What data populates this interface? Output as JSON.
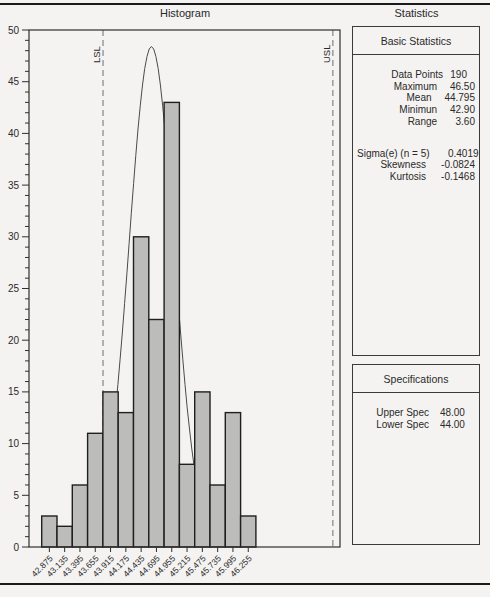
{
  "header": {
    "chart_title": "Histogram",
    "stats_title": "Statistics"
  },
  "chart_data": {
    "type": "bar",
    "title": "Histogram",
    "categories": [
      "42.875",
      "43.135",
      "43.395",
      "43.655",
      "43.915",
      "44.175",
      "44.435",
      "44.695",
      "44.955",
      "45.215",
      "45.475",
      "45.735",
      "45.995",
      "46.255"
    ],
    "values": [
      3,
      2,
      6,
      11,
      15,
      13,
      30,
      22,
      43,
      8,
      15,
      6,
      13,
      3
    ],
    "xlabel": "",
    "ylabel": "",
    "ylim": [
      0,
      50
    ],
    "y_major_step": 5,
    "y_minor_step": 1,
    "bin_width": 0.26,
    "grid": false,
    "legend": false,
    "bar_fill": "#bcbcba",
    "bar_stroke": "#1f1f1f",
    "normal_curve": {
      "center": 44.61,
      "sigma": 0.38,
      "peak": 48.4
    },
    "ref_lines": [
      {
        "label": "LSL",
        "x_frac": 0.238
      },
      {
        "label": "USL",
        "x_frac": 0.977
      }
    ]
  },
  "stats_panel": {
    "title": "Statistics",
    "basic": {
      "title": "Basic Statistics",
      "rows": [
        {
          "label": "Data Points",
          "value": "190"
        },
        {
          "label": "Maximum",
          "value": "46.50"
        },
        {
          "label": "Mean",
          "value": "44.795"
        },
        {
          "label": "Minimun",
          "value": "42.90"
        },
        {
          "label": "Range",
          "value": "3.60"
        }
      ],
      "rows2": [
        {
          "label": "Sigma(e) (n = 5)",
          "value": "0.4019"
        },
        {
          "label": "Skewness",
          "value": "-0.0824"
        },
        {
          "label": "Kurtosis",
          "value": "-0.1468"
        }
      ]
    },
    "specifications": {
      "title": "Specifications",
      "rows": [
        {
          "label": "Upper Spec",
          "value": "48.00"
        },
        {
          "label": "Lower Spec",
          "value": "44.00"
        }
      ]
    }
  },
  "colors": {
    "page_bg": "#f4f3f1",
    "rule": "#1a1a1a",
    "dashed_line": "#8c8c8c",
    "curve_line": "#4a4a4a",
    "axis": "#2f2f2f"
  }
}
